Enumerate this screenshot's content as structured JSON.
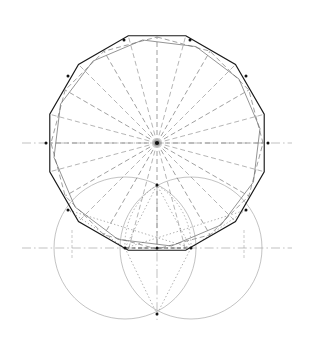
{
  "figure": {
    "canvas": {
      "width": 311,
      "height": 349,
      "background": "#ffffff"
    }
  },
  "colors": {
    "solid_outline": "#1a1a1a",
    "dashed_construction": "#777777",
    "dotted_construction": "#8c8c8c",
    "circle_stroke": "#9a9a9a",
    "axis": "#a6a6a6",
    "vertex_marker": "#111111",
    "thin_solid_inner": "#666666"
  },
  "strokes": {
    "solid_outline_width": 1.15,
    "inner_polygon_width": 0.7,
    "dashed_width": 0.7,
    "dotted_width": 0.7,
    "circle_width": 0.6,
    "axis_width": 0.7,
    "dash_pattern": "5,3",
    "dot_pattern": "1.4,2.2",
    "axis_pattern": "9,3,1.6,3"
  },
  "geometry": {
    "center": {
      "x": 157,
      "y": 143,
      "label": "polygon-center"
    },
    "main_polygon": {
      "type": "dodecagon",
      "sides": 12,
      "circumradius": 111,
      "rotation_deg": 15,
      "style": "solid"
    },
    "inner_polygon": {
      "type": "dodecagon",
      "sides": 12,
      "circumradius": 104,
      "rotation_deg": 22,
      "style": "thin-solid"
    },
    "dashed_polygon": {
      "type": "dodecagon",
      "sides": 12,
      "circumradius": 106,
      "rotation_deg": 0,
      "style": "dashed"
    },
    "upper_axis": {
      "y": 143,
      "x1": 22,
      "x2": 292,
      "style": "dash-dot"
    },
    "lower_axis": {
      "y": 248,
      "x1": 22,
      "x2": 292,
      "style": "dash-dot"
    },
    "vertical_axis": {
      "x": 157,
      "y1": 186,
      "y2": 320,
      "style": "dash-dot"
    },
    "circles": [
      {
        "name": "left-circle",
        "cx": 125,
        "cy": 248,
        "r": 71
      },
      {
        "name": "right-circle",
        "cx": 191,
        "cy": 248,
        "r": 71
      }
    ],
    "marked_vertices": [
      {
        "name": "center-hub",
        "x": 157,
        "y": 143
      },
      {
        "name": "left-equator-vertex",
        "x": 46,
        "y": 143
      },
      {
        "name": "right-equator-vertex",
        "x": 268,
        "y": 143
      },
      {
        "name": "upper-left-vertex",
        "x": 68,
        "y": 76
      },
      {
        "name": "upper-right-vertex",
        "x": 246,
        "y": 76
      },
      {
        "name": "top-left-shoulder",
        "x": 124,
        "y": 40
      },
      {
        "name": "top-right-shoulder",
        "x": 190,
        "y": 40
      },
      {
        "name": "lower-left-vertex",
        "x": 68,
        "y": 210
      },
      {
        "name": "lower-right-vertex",
        "x": 246,
        "y": 210
      },
      {
        "name": "left-circle-center",
        "x": 125,
        "y": 248
      },
      {
        "name": "right-circle-center",
        "x": 191,
        "y": 248
      },
      {
        "name": "circles-bottom-intersection",
        "x": 157,
        "y": 314
      },
      {
        "name": "circles-top-intersection",
        "x": 157,
        "y": 185
      },
      {
        "name": "lower-axis-midpoint",
        "x": 157,
        "y": 248
      }
    ],
    "radial_spokes_count": 12,
    "secondary_fan_count": 7
  }
}
